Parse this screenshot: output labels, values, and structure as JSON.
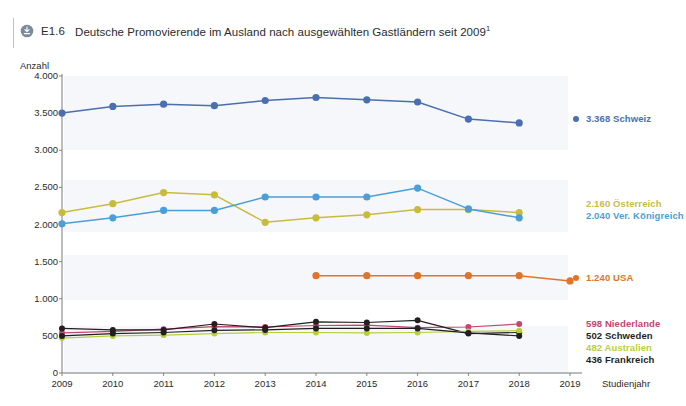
{
  "header": {
    "icon": "download-circle-icon",
    "number": "E1.6",
    "title": "Deutsche Promovierende im Ausland nach ausgewählten Gastländern seit 2009",
    "footnote_marker": "1"
  },
  "axes": {
    "y_unit_label": "Anzahl",
    "x_name_label": "Studienjahr",
    "y_ticks": [
      "0",
      "500",
      "1.000",
      "1.500",
      "2.000",
      "2.500",
      "3.000",
      "3.500",
      "4.000"
    ],
    "x_ticks": [
      "2009",
      "2010",
      "2011",
      "2012",
      "2013",
      "2014",
      "2015",
      "2016",
      "2017",
      "2018",
      "2019"
    ]
  },
  "legend": [
    {
      "label": "3.368 Schweiz",
      "value": "3.368",
      "country": "Schweiz",
      "color": "#4a6fb0",
      "dot": true
    },
    {
      "label": "2.160 Österreich",
      "value": "2.160",
      "country": "Österreich",
      "color": "#c8bc3f",
      "dot": false
    },
    {
      "label": "2.040 Ver. Königreich",
      "value": "2.040",
      "country": "Ver. Königreich",
      "color": "#4a9fd8",
      "dot": false
    },
    {
      "label": "1.240 USA",
      "value": "1.240",
      "country": "USA",
      "color": "#e2742a",
      "dot": true
    },
    {
      "label": "598 Niederlande",
      "value": "598",
      "country": "Niederlande",
      "color": "#c4456f",
      "dot": false
    },
    {
      "label": "502 Schweden",
      "value": "502",
      "country": "Schweden",
      "color": "#231f20",
      "dot": false
    },
    {
      "label": "482 Australien",
      "value": "482",
      "country": "Australien",
      "color": "#b8cf3c",
      "dot": false
    },
    {
      "label": "436 Frankreich",
      "value": "436",
      "country": "Frankreich",
      "color": "#231f20",
      "dot": false
    }
  ],
  "chart_data": {
    "type": "line",
    "title": "Deutsche Promovierende im Ausland nach ausgewählten Gastländern seit 2009",
    "xlabel": "Studienjahr",
    "ylabel": "Anzahl",
    "x": [
      2009,
      2010,
      2011,
      2012,
      2013,
      2014,
      2015,
      2016,
      2017,
      2018,
      2019
    ],
    "ylim": [
      0,
      4000
    ],
    "ytick_step": 500,
    "grid": false,
    "legend_position": "right",
    "series": [
      {
        "name": "Schweiz",
        "color": "#4a6fb0",
        "x": [
          2009,
          2010,
          2011,
          2012,
          2013,
          2014,
          2015,
          2016,
          2017,
          2018,
          2019
        ],
        "values": [
          3500,
          3590,
          3620,
          3600,
          3670,
          3710,
          3680,
          3650,
          3420,
          3368,
          null
        ],
        "last_value": 3368
      },
      {
        "name": "Österreich",
        "color": "#c8bc3f",
        "x": [
          2009,
          2010,
          2011,
          2012,
          2013,
          2014,
          2015,
          2016,
          2017,
          2018
        ],
        "values": [
          2160,
          2280,
          2430,
          2400,
          2030,
          2090,
          2130,
          2200,
          2200,
          2160
        ],
        "last_value": 2160
      },
      {
        "name": "Ver. Königreich",
        "color": "#4a9fd8",
        "x": [
          2009,
          2010,
          2011,
          2012,
          2013,
          2014,
          2015,
          2016,
          2017,
          2018
        ],
        "values": [
          2010,
          2090,
          2190,
          2190,
          2370,
          2370,
          2370,
          2490,
          2210,
          2090
        ],
        "last_value": 2040
      },
      {
        "name": "USA",
        "color": "#e2742a",
        "x": [
          2014,
          2015,
          2016,
          2017,
          2018,
          2019
        ],
        "values": [
          1310,
          1310,
          1310,
          1310,
          1310,
          1240
        ],
        "last_value": 1240
      },
      {
        "name": "Niederlande",
        "color": "#c4456f",
        "x": [
          2009,
          2010,
          2011,
          2012,
          2013,
          2014,
          2015,
          2016,
          2017,
          2018
        ],
        "values": [
          540,
          560,
          590,
          625,
          620,
          640,
          645,
          610,
          620,
          660
        ],
        "last_value": 598
      },
      {
        "name": "Schweden",
        "color": "#231f20",
        "x": [
          2009,
          2010,
          2011,
          2012,
          2013,
          2014,
          2015,
          2016,
          2017,
          2018
        ],
        "values": [
          600,
          580,
          580,
          660,
          610,
          690,
          680,
          710,
          530,
          545
        ],
        "last_value": 502
      },
      {
        "name": "Australien",
        "color": "#b8cf3c",
        "x": [
          2009,
          2010,
          2011,
          2012,
          2013,
          2014,
          2015,
          2016,
          2017,
          2018
        ],
        "values": [
          470,
          500,
          510,
          530,
          545,
          545,
          540,
          545,
          560,
          570
        ],
        "last_value": 482
      },
      {
        "name": "Frankreich",
        "color": "#231f20",
        "x": [
          2009,
          2010,
          2011,
          2012,
          2013,
          2014,
          2015,
          2016,
          2017,
          2018
        ],
        "values": [
          500,
          530,
          545,
          575,
          580,
          600,
          600,
          600,
          540,
          500
        ],
        "last_value": 436
      }
    ]
  }
}
